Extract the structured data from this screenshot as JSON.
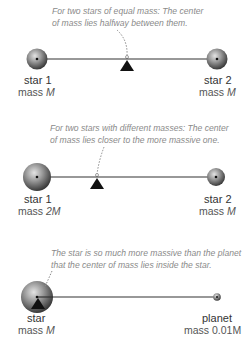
{
  "colors": {
    "line": "#333333",
    "fulcrum": "#111111",
    "caption": "#8a8a8a",
    "sphere_light": "#d8d8d8",
    "sphere_dark": "#3a3a3a"
  },
  "panels": [
    {
      "caption_line1": "For two stars of equal mass: The center",
      "caption_line2": "of mass lies halfway between them.",
      "left": {
        "name": "star 1",
        "mass_prefix": "mass ",
        "mass_value": "M"
      },
      "right": {
        "name": "star 2",
        "mass_prefix": "mass ",
        "mass_value": "M"
      }
    },
    {
      "caption_line1": "For two stars with different masses: The center",
      "caption_line2": "of mass lies closer to the more massive one.",
      "left": {
        "name": "star 1",
        "mass_prefix": "mass ",
        "mass_value": "2M"
      },
      "right": {
        "name": "star 2",
        "mass_prefix": "mass ",
        "mass_value": "M"
      }
    },
    {
      "caption_line1": "The star is so much more massive than the planet",
      "caption_line2": "that the center of mass lies inside the star.",
      "left": {
        "name": "star",
        "mass_prefix": "mass ",
        "mass_value": "M"
      },
      "right": {
        "name": "planet",
        "mass_prefix": "mass ",
        "mass_value": "0.01M"
      }
    }
  ]
}
